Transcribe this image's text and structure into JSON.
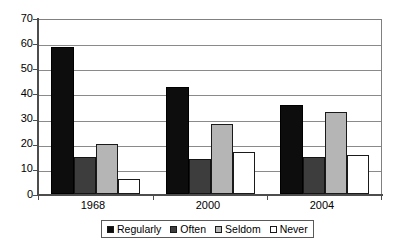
{
  "chart_data": {
    "type": "bar",
    "title": "",
    "subtitle": "",
    "xlabel": "",
    "ylabel": "",
    "categories": [
      "1968",
      "2000",
      "2004"
    ],
    "series": [
      {
        "name": "Regularly",
        "color": "#0d0d0d",
        "values": [
          59,
          43,
          36
        ]
      },
      {
        "name": "Often",
        "color": "#3d3d3d",
        "values": [
          15,
          14,
          15
        ]
      },
      {
        "name": "Seldom",
        "color": "#b5b5b5",
        "values": [
          20,
          28,
          33
        ]
      },
      {
        "name": "Never",
        "color": "#ffffff",
        "values": [
          6,
          17,
          15.5
        ]
      }
    ],
    "ylim": [
      0,
      70
    ],
    "ytick_labels": [
      "0",
      "10",
      "20",
      "30",
      "40",
      "50",
      "60",
      "70"
    ],
    "ytick_values": [
      0,
      10,
      20,
      30,
      40,
      50,
      60,
      70
    ],
    "grid": "horizontal",
    "legend_position": "bottom",
    "legend_entries": [
      "Regularly",
      "Often",
      "Seldom",
      "Never"
    ]
  },
  "axis": {
    "y_label_0": "0",
    "y_label_10": "10",
    "y_label_20": "20",
    "y_label_30": "30",
    "y_label_40": "40",
    "y_label_50": "50",
    "y_label_60": "60",
    "y_label_70": "70"
  },
  "categories": {
    "cat_0": "1968",
    "cat_1": "2000",
    "cat_2": "2004"
  },
  "legend": {
    "item_0": "Regularly",
    "item_1": "Often",
    "item_2": "Seldom",
    "item_3": "Never"
  }
}
